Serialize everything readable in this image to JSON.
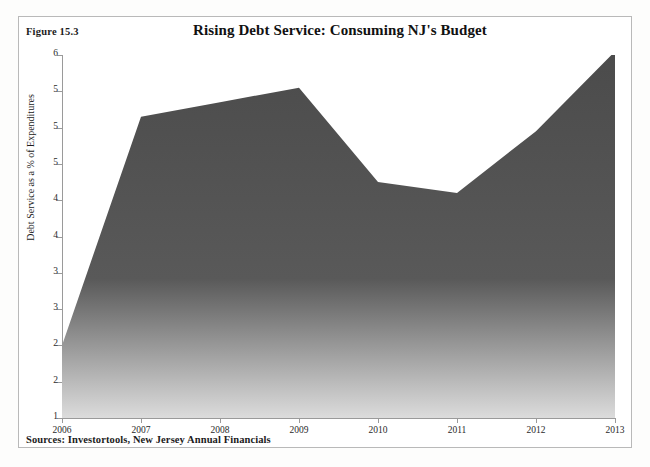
{
  "figure": {
    "label": "Figure 15.3",
    "sources": "Sources: Investortools, New Jersey Annual Financials"
  },
  "chart_data": {
    "type": "area",
    "title": "Rising Debt Service: Consuming NJ's Budget",
    "xlabel": "",
    "ylabel": "Debt Service as a % of Expenditures",
    "categories": [
      "2006",
      "2007",
      "2008",
      "2009",
      "2010",
      "2011",
      "2012",
      "2013"
    ],
    "values": [
      2.0,
      5.15,
      5.35,
      5.55,
      4.25,
      4.1,
      4.95,
      6.05
    ],
    "series": [
      {
        "name": "Debt Service as a % of Expenditures",
        "values": [
          2.0,
          5.15,
          5.35,
          5.55,
          4.25,
          4.1,
          4.95,
          6.05
        ]
      }
    ],
    "ylim": [
      1,
      6
    ],
    "y_tick_step": 0.5,
    "y_tick_values": [
      6,
      5.5,
      5,
      4.5,
      4,
      3.5,
      3,
      2.5,
      2,
      1.5,
      1
    ],
    "y_tick_labels": [
      "6",
      "5",
      "5",
      "5",
      "4",
      "4",
      "3",
      "3",
      "2",
      "2",
      "1"
    ],
    "x_tick_labels": [
      "2006",
      "2007",
      "2008",
      "2009",
      "2010",
      "2011",
      "2012",
      "2013"
    ],
    "grid": false,
    "legend": "none",
    "fill_gradient_top": "#4b4b4b",
    "fill_gradient_bottom": "#dcdcdc",
    "axis_color": "#9a9a9a"
  }
}
